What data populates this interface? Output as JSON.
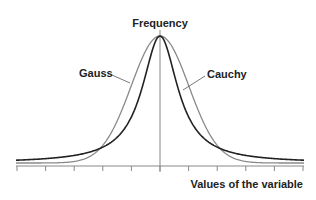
{
  "chart_data": {
    "type": "line",
    "title": "",
    "ylabel": "Frequency",
    "xlabel": "Values of the variable",
    "x_ticks_count": 11,
    "tick_labels": [],
    "grid": false,
    "legend": "none (curves annotated with leader labels)",
    "x_range": [
      -5,
      5
    ],
    "series": [
      {
        "name": "Gauss",
        "kind": "normal",
        "center": 0,
        "sigma": 1.0,
        "peak": 1.0,
        "color": "#8a8a8a"
      },
      {
        "name": "Cauchy",
        "kind": "cauchy",
        "center": 0,
        "gamma": 0.75,
        "peak": 1.0,
        "color": "#222222"
      }
    ],
    "annotations": [
      {
        "text": "Gauss",
        "points_to": "Gauss curve, left flank"
      },
      {
        "text": "Cauchy",
        "points_to": "Cauchy curve, right flank"
      }
    ]
  },
  "labels": {
    "y_axis": "Frequency",
    "x_axis": "Values of the variable",
    "gauss": "Gauss",
    "cauchy": "Cauchy"
  }
}
